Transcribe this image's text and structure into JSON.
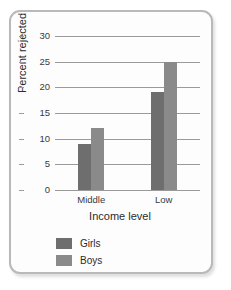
{
  "chart_data": {
    "type": "bar",
    "title": "",
    "xlabel": "Income level",
    "ylabel": "Percent rejected",
    "categories": [
      "Middle",
      "Low"
    ],
    "series": [
      {
        "name": "Girls",
        "values": [
          9,
          19
        ],
        "color": "#6e6e6e"
      },
      {
        "name": "Boys",
        "values": [
          12,
          25
        ],
        "color": "#8a8a8a"
      }
    ],
    "ylim": [
      0,
      30
    ],
    "yticks": [
      0,
      5,
      10,
      15,
      20,
      25,
      30
    ],
    "ytick_labels": [
      "0",
      "5",
      "10",
      "15",
      "20",
      "25",
      "30"
    ],
    "grid": true,
    "legend_position": "bottom-left",
    "frame_color": "#b9b9b9",
    "gridline_color": "#9a9a9a",
    "background_color": "#fdfdfd"
  }
}
